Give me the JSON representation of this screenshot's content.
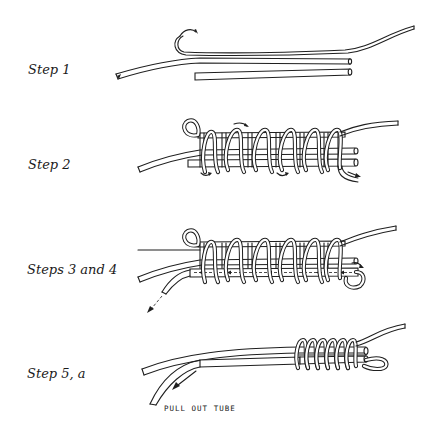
{
  "figure": {
    "steps": [
      {
        "id": "step1",
        "label": "Step 1"
      },
      {
        "id": "step2",
        "label": "Step 2"
      },
      {
        "id": "step3-4",
        "label": "Steps 3 and 4"
      },
      {
        "id": "step5a",
        "label": "Step 5, a"
      }
    ],
    "annotations": {
      "pull_out_tube": "PULL OUT TUBE"
    },
    "colors": {
      "background": "#ffffff",
      "ink": "#1f1f1f"
    }
  }
}
